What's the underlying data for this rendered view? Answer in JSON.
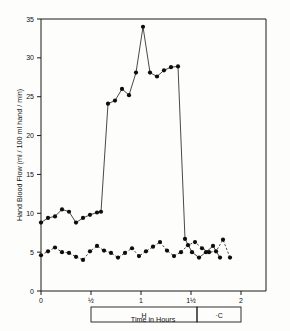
{
  "figure": {
    "background_color": "#fdfdfc",
    "ink_color": "#1a1a1a"
  },
  "chart_data": {
    "type": "line",
    "title": "",
    "xlabel": "Time in Hours",
    "ylabel": "Hand Blood Flow  (ml / 100 ml hand / min)",
    "xlim": [
      0,
      2.25
    ],
    "ylim": [
      0,
      35
    ],
    "grid": false,
    "legend": "none",
    "x_tick_values": [
      0,
      0.5,
      1,
      1.5,
      2
    ],
    "x_tick_labels": [
      "0",
      "½",
      "1",
      "1½",
      "2"
    ],
    "y_tick_values": [
      0,
      5,
      10,
      15,
      20,
      25,
      30,
      35
    ],
    "y_tick_labels": [
      "0",
      "5",
      "10",
      "15",
      "20",
      "25",
      "30",
      "35"
    ],
    "series": [
      {
        "name": "hand-blood-flow-experimental",
        "style": "solid",
        "marker": "filled-circle",
        "x": [
          0.0,
          0.07,
          0.14,
          0.21,
          0.28,
          0.35,
          0.42,
          0.49,
          0.56,
          0.6,
          0.67,
          0.74,
          0.81,
          0.88,
          0.95,
          1.02,
          1.09,
          1.16,
          1.23,
          1.3,
          1.37,
          1.44,
          1.51,
          1.58,
          1.65,
          1.72,
          1.79
        ],
        "y": [
          8.8,
          9.4,
          9.6,
          10.5,
          10.2,
          8.8,
          9.4,
          9.8,
          10.1,
          10.2,
          24.1,
          24.5,
          26.0,
          25.2,
          28.1,
          34.0,
          28.1,
          27.6,
          28.4,
          28.8,
          28.9,
          6.7,
          5.0,
          4.3,
          5.0,
          5.8,
          4.3
        ]
      },
      {
        "name": "hand-blood-flow-control",
        "style": "dashed",
        "marker": "filled-circle",
        "x": [
          0.0,
          0.07,
          0.14,
          0.21,
          0.28,
          0.35,
          0.42,
          0.49,
          0.56,
          0.63,
          0.7,
          0.77,
          0.84,
          0.91,
          0.98,
          1.05,
          1.12,
          1.19,
          1.26,
          1.33,
          1.4,
          1.47,
          1.54,
          1.61,
          1.68,
          1.75,
          1.82,
          1.89
        ],
        "y": [
          4.6,
          5.1,
          5.6,
          5.0,
          4.9,
          4.4,
          4.0,
          5.1,
          5.8,
          5.2,
          4.9,
          4.3,
          4.9,
          5.5,
          4.5,
          5.1,
          5.7,
          6.3,
          5.2,
          4.5,
          5.0,
          5.9,
          6.3,
          5.5,
          5.0,
          5.1,
          6.6,
          4.3
        ]
      }
    ],
    "annotations": [
      {
        "name": "treatment-interval-h",
        "label": "H",
        "x_start": 0.5,
        "x_end": 1.56,
        "description": "heating period bar below axis"
      },
      {
        "name": "treatment-interval-c",
        "label": "·C",
        "x_start": 1.56,
        "x_end": 2.0,
        "description": "cooling period bar below axis"
      }
    ]
  }
}
